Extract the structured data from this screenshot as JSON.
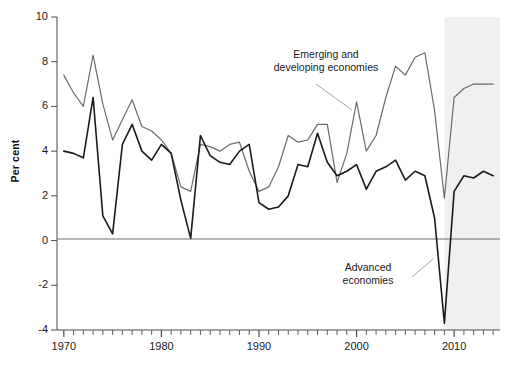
{
  "chart_data": {
    "type": "line",
    "title": "",
    "subtitle": "",
    "xlabel": "",
    "ylabel": "Per cent",
    "xlim": [
      1969.3,
      2014.7
    ],
    "ylim": [
      -4,
      10
    ],
    "yticks": [
      -4,
      -2,
      0,
      2,
      4,
      6,
      8,
      10
    ],
    "ytick_labels": [
      "-4",
      "-2",
      "0",
      "2",
      "4",
      "6",
      "8",
      "10"
    ],
    "xticks": [
      1970,
      1980,
      1990,
      2000,
      2010
    ],
    "xtick_labels": [
      "1970",
      "1980",
      "1990",
      "2000",
      "2010"
    ],
    "xminor_step": 1,
    "grid": false,
    "zero_line": 0,
    "legend": "annotations",
    "shaded_region": {
      "label": "forecast",
      "start": 2009.0,
      "end": 2014.7,
      "color": "#f0f0f0"
    },
    "x": [
      1970,
      1971,
      1972,
      1973,
      1974,
      1975,
      1976,
      1977,
      1978,
      1979,
      1980,
      1981,
      1982,
      1983,
      1984,
      1985,
      1986,
      1987,
      1988,
      1989,
      1990,
      1991,
      1992,
      1993,
      1994,
      1995,
      1996,
      1997,
      1998,
      1999,
      2000,
      2001,
      2002,
      2003,
      2004,
      2005,
      2006,
      2007,
      2008,
      2009,
      2010,
      2011,
      2012,
      2013,
      2014
    ],
    "series": [
      {
        "name": "Emerging and developing economies",
        "color": "#6b6b6b",
        "width": 1.2,
        "values": [
          7.4,
          6.6,
          6.0,
          8.3,
          6.1,
          4.5,
          5.4,
          6.3,
          5.1,
          4.9,
          4.5,
          3.9,
          2.4,
          2.2,
          4.3,
          4.2,
          4.0,
          4.3,
          4.4,
          3.1,
          2.2,
          2.4,
          3.3,
          4.7,
          4.4,
          4.5,
          5.2,
          5.2,
          2.6,
          3.9,
          6.2,
          4.0,
          4.7,
          6.4,
          7.8,
          7.4,
          8.2,
          8.4,
          5.8,
          1.9,
          6.4,
          6.8,
          7.0,
          7.0,
          7.0
        ]
      },
      {
        "name": "Advanced economies",
        "color": "#1a1a1a",
        "width": 1.6,
        "values": [
          4.0,
          3.9,
          3.7,
          6.4,
          1.1,
          0.3,
          4.3,
          5.2,
          4.0,
          3.6,
          4.3,
          3.9,
          1.8,
          0.1,
          4.7,
          3.8,
          3.5,
          3.4,
          4.0,
          4.3,
          1.7,
          1.4,
          1.5,
          2.0,
          3.4,
          3.3,
          4.8,
          3.5,
          2.9,
          3.1,
          3.4,
          2.3,
          3.1,
          3.3,
          3.6,
          2.7,
          3.1,
          2.9,
          1.0,
          -3.7,
          2.2,
          2.9,
          2.8,
          3.1,
          2.9
        ]
      }
    ],
    "annotations": [
      {
        "name": "emerging-and-developing-economies-label",
        "text": "Emerging and\ndeveloping economies",
        "x": 1994.5,
        "y": 8.0
      },
      {
        "name": "advanced-economies-label",
        "text": "Advanced\neconomies",
        "x": 2000.0,
        "y": -1.5
      }
    ]
  }
}
